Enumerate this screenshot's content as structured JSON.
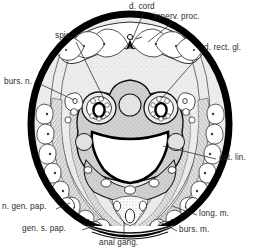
{
  "figure": {
    "type": "anatomical-cross-section",
    "orientation": "dorsal at top, ventral at bottom",
    "background_color": "#ffffff",
    "ink_color": "#1a1a1a",
    "label_color": "#2b2b2b",
    "cuticle_color": "#000000",
    "tissue_fill": "#c9c9c9",
    "hypodermis_fill": "#e6e6e6",
    "lumen_fill": "#ffffff"
  },
  "labels": [
    {
      "id": "d-cord",
      "text": "d. cord",
      "x": 129,
      "y": 4,
      "anchor": "start",
      "leader_from": [
        143,
        14
      ],
      "leader_to": [
        132,
        40
      ]
    },
    {
      "id": "innerv-proc",
      "text": "innerv. proc.",
      "x": 156,
      "y": 14,
      "anchor": "start",
      "leader_from": [
        172,
        23
      ],
      "leader_to": [
        148,
        42
      ]
    },
    {
      "id": "spic",
      "text": "spic.",
      "x": 55,
      "y": 34,
      "anchor": "start",
      "leader_from": [
        76,
        42
      ],
      "leader_to": [
        104,
        99
      ]
    },
    {
      "id": "d-rect-gl",
      "text": "d. rect. gl.",
      "x": 204,
      "y": 45,
      "anchor": "start",
      "leader_from": [
        203,
        51
      ],
      "leader_to": [
        162,
        98
      ]
    },
    {
      "id": "burs-n",
      "text": "burs. n.",
      "x": 6,
      "y": 80,
      "anchor": "start",
      "leader_from": [
        40,
        85
      ],
      "leader_to": [
        72,
        100
      ]
    },
    {
      "id": "cut-lin",
      "text": "cut. lin.",
      "x": 218,
      "y": 156,
      "anchor": "start",
      "leader_from": [
        217,
        160
      ],
      "leader_to": [
        163,
        146
      ]
    },
    {
      "id": "n-gen-pap",
      "text": "n. gen. pap.",
      "x": 4,
      "y": 205,
      "anchor": "start",
      "leader_from": [
        56,
        210
      ],
      "leader_to": [
        66,
        205
      ]
    },
    {
      "id": "long-m",
      "text": "long. m.",
      "x": 198,
      "y": 212,
      "anchor": "start",
      "leader_from": [
        197,
        216
      ],
      "leader_to": [
        172,
        208
      ]
    },
    {
      "id": "gen-s-pap",
      "text": "gen. s. pap.",
      "x": 24,
      "y": 227,
      "anchor": "start",
      "leader_from": [
        82,
        231
      ],
      "leader_to": [
        96,
        226
      ]
    },
    {
      "id": "burs-m",
      "text": "burs. m.",
      "x": 178,
      "y": 228,
      "anchor": "start",
      "leader_from": [
        177,
        232
      ],
      "leader_to": [
        158,
        222
      ]
    },
    {
      "id": "anal-gang",
      "text": "anal gang.",
      "x": 100,
      "y": 240,
      "anchor": "start",
      "leader_from": [
        124,
        240
      ],
      "leader_to": [
        124,
        222
      ]
    }
  ],
  "structures": [
    {
      "id": "body-cuticle",
      "name": "outer body cuticle ring"
    },
    {
      "id": "dorsal-lobes",
      "name": "dorsal rectal gland lobes"
    },
    {
      "id": "spicule-left",
      "name": "left spicule in sheath"
    },
    {
      "id": "spicule-right",
      "name": "right spicule in sheath"
    },
    {
      "id": "gubernaculum",
      "name": "central dorsal body"
    },
    {
      "id": "cloacal-lumen",
      "name": "cloacal lumen"
    },
    {
      "id": "bursal-muscles",
      "name": "bursal muscle bands"
    },
    {
      "id": "cuticular-lining",
      "name": "scalloped cuticular lining cells"
    },
    {
      "id": "anal-ganglion",
      "name": "anal ganglion stipple"
    }
  ]
}
